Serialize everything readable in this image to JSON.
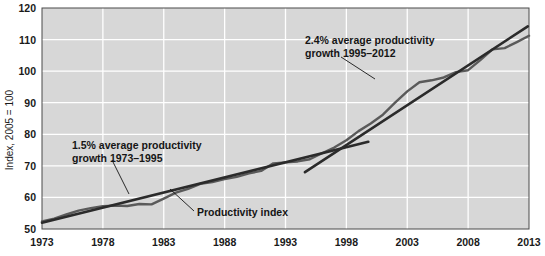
{
  "chart_data": {
    "type": "line",
    "title": "",
    "xlabel": "",
    "ylabel": "Index, 2005 = 100",
    "xlim": [
      1973,
      2013
    ],
    "ylim": [
      50,
      120
    ],
    "grid": true,
    "legend_position": "inline-annotations",
    "background_color": "#d7d7d7",
    "gridline_color": "#ffffff",
    "line_color": "#5a5a5a",
    "trend_color": "#2b2b2b",
    "x_ticks": [
      1973,
      1978,
      1983,
      1988,
      1993,
      1998,
      2003,
      2008,
      2013
    ],
    "x_tick_labels": [
      "1973",
      "1978",
      "1983",
      "1988",
      "1993",
      "1998",
      "2003",
      "2008",
      "2013"
    ],
    "y_ticks": [
      50,
      60,
      70,
      80,
      90,
      100,
      110,
      120
    ],
    "y_tick_labels": [
      "50",
      "60",
      "70",
      "80",
      "90",
      "100",
      "110",
      "120"
    ],
    "series": [
      {
        "name": "Productivity index",
        "color": "#5a5a5a",
        "x": [
          1973,
          1974,
          1975,
          1976,
          1977,
          1978,
          1979,
          1980,
          1981,
          1982,
          1983,
          1984,
          1985,
          1986,
          1987,
          1988,
          1989,
          1990,
          1991,
          1992,
          1993,
          1994,
          1995,
          1996,
          1997,
          1998,
          1999,
          2000,
          2001,
          2002,
          2003,
          2004,
          2005,
          2006,
          2007,
          2008,
          2009,
          2010,
          2011,
          2012
        ],
        "values": [
          52.4,
          53.3,
          54.6,
          55.8,
          56.6,
          57.2,
          57.4,
          57.3,
          57.9,
          57.8,
          59.6,
          61.5,
          62.7,
          64.3,
          64.9,
          65.8,
          66.5,
          67.6,
          68.4,
          70.8,
          71.1,
          71.4,
          72.1,
          74.0,
          75.8,
          78.1,
          81.0,
          83.4,
          86.2,
          90.0,
          93.6,
          96.5,
          97.1,
          98.0,
          99.7,
          100.3,
          103.5,
          106.9,
          107.3,
          109.2
        ],
        "end_value_2013": 111.2
      }
    ],
    "trend_lines": [
      {
        "name": "1.5% average productivity growth 1973-1995",
        "color": "#2b2b2b",
        "x_start": 1973,
        "x_end": 1999.8,
        "y_start": 52.0,
        "y_end": 77.6,
        "annotation_line1": "1.5% average productivity",
        "annotation_line2": "growth 1973–1995",
        "growth_rate_pct": 1.5,
        "period": "1973–1995"
      },
      {
        "name": "2.4% average productivity growth 1995-2012",
        "color": "#2b2b2b",
        "x_start": 1994.6,
        "x_end": 2012.9,
        "y_start": 68.0,
        "y_end": 114.2,
        "annotation_line1": "2.4% average productivity",
        "annotation_line2": "growth 1995–2012",
        "growth_rate_pct": 2.4,
        "period": "1995–2012"
      }
    ],
    "annotations": [
      {
        "id": "annotation-growth-1973-1995",
        "line1": "1.5% average productivity",
        "line2": "growth 1973–1995",
        "text_x": 72,
        "text_y": 149,
        "leader_from_x": 112,
        "leader_from_y": 160,
        "leader_to_x": 129,
        "leader_to_y": 194
      },
      {
        "id": "annotation-growth-1995-2012",
        "line1": "2.4% average productivity",
        "line2": "growth 1995–2012",
        "text_x": 305,
        "text_y": 44,
        "leader_from_x": 341,
        "leader_from_y": 57,
        "leader_to_x": 375,
        "leader_to_y": 79
      },
      {
        "id": "annotation-productivity-index",
        "line1": "Productivity index",
        "text_x": 197,
        "text_y": 215,
        "leader_from_x": 194,
        "leader_from_y": 211,
        "leader_to_x": 170,
        "leader_to_y": 189
      }
    ]
  }
}
